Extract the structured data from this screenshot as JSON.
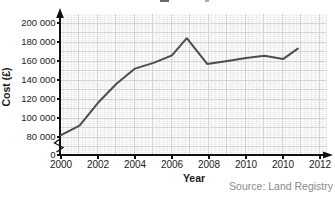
{
  "chart": {
    "ylabel": "Cost (£)",
    "xlabel": "Year",
    "source": "Source: Land Registry",
    "colors": {
      "line": "#4d4d4d",
      "axis": "#111111",
      "grid_minor_v": "#e8e8e8",
      "grid_minor_h": "#f1f1f1",
      "grid_major": "#d4d4d4",
      "tick_text": "#222222",
      "source_text": "#8a8a8a"
    }
  },
  "chart_data": {
    "type": "line",
    "xlabel": "Year",
    "ylabel": "Cost (£)",
    "source": "Source: Land Registry",
    "x_tick_labels": [
      "2000",
      "2002",
      "2004",
      "2006",
      "2008",
      "2010",
      "2010",
      "2012"
    ],
    "y_tick_labels": [
      "200 000",
      "180 000",
      "160 000",
      "140 000",
      "120 000",
      "100 000",
      "80 000",
      "0"
    ],
    "y_tick_values": [
      200000,
      180000,
      160000,
      140000,
      120000,
      100000,
      80000,
      0
    ],
    "ylim": [
      0,
      200000
    ],
    "y_axis_break_below": 80000,
    "grid": "fine graph-paper grid, on",
    "legend": "none",
    "points": [
      {
        "t": 0.0,
        "value": 82000
      },
      {
        "t": 0.5,
        "value": 92000
      },
      {
        "t": 1.0,
        "value": 116000
      },
      {
        "t": 1.5,
        "value": 136000
      },
      {
        "t": 2.0,
        "value": 152000
      },
      {
        "t": 2.5,
        "value": 158000
      },
      {
        "t": 3.0,
        "value": 166000
      },
      {
        "t": 3.4,
        "value": 184000
      },
      {
        "t": 3.95,
        "value": 157000
      },
      {
        "t": 4.5,
        "value": 160000
      },
      {
        "t": 5.0,
        "value": 163000
      },
      {
        "t": 5.5,
        "value": 165500
      },
      {
        "t": 6.0,
        "value": 162000
      },
      {
        "t": 6.4,
        "value": 173000
      }
    ],
    "t_unit": "distance between labeled x ticks (nominally 2 years starting at 2000)"
  }
}
